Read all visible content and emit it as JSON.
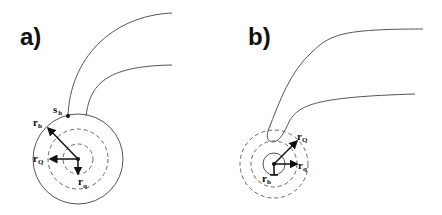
{
  "figure": {
    "panels": [
      {
        "id": "a",
        "label": "a)",
        "symbols": {
          "s_h": {
            "main": "s",
            "sub": "h"
          },
          "r_h": {
            "main": "r",
            "sub": "h"
          },
          "r_Q": {
            "main": "r",
            "sub": "Q"
          },
          "r_q": {
            "main": "r",
            "sub": "q"
          }
        },
        "description": "Large solid circle (r_h) with two dashed inner circles (r_Q, r_q) and a curved tail attached at point s_h"
      },
      {
        "id": "b",
        "label": "b)",
        "symbols": {
          "r_Q": {
            "main": "r",
            "sub": "Q"
          },
          "r_q": {
            "main": "r",
            "sub": "q"
          },
          "r_h": {
            "main": "r",
            "sub": "h"
          }
        },
        "description": "Small solid circle (r_h) inside two dashed circles (r_q, r_Q) with curved tail emerging from outer dashed circle"
      }
    ],
    "colors": {
      "stroke": "#555555",
      "dashed": "#666666",
      "text": "#111111",
      "background": "#ffffff"
    }
  }
}
